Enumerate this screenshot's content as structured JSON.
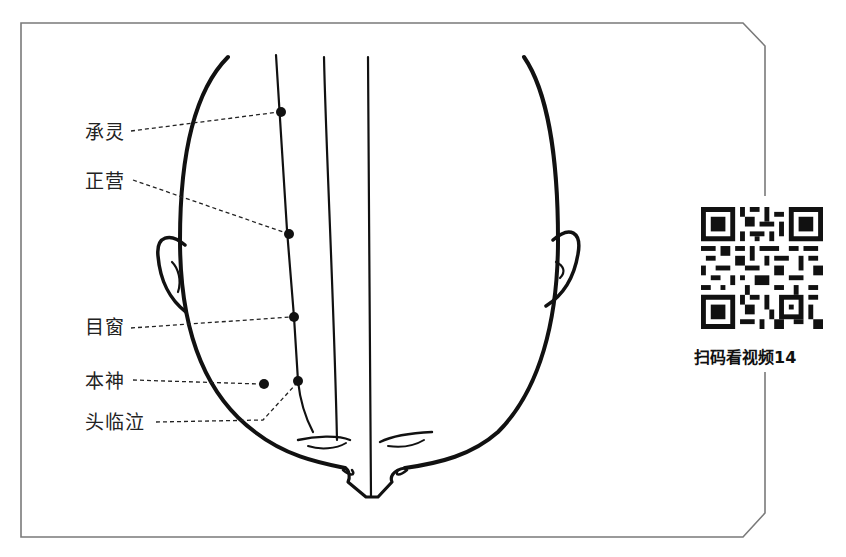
{
  "figure": {
    "stroke_color": "#111111",
    "frame_color": "#777777"
  },
  "labels": [
    {
      "id": "chengling",
      "text": "承灵",
      "x": 85,
      "y": 121,
      "point": {
        "x": 281,
        "y": 112
      }
    },
    {
      "id": "zhengying",
      "text": "正营",
      "x": 85,
      "y": 170,
      "point": {
        "x": 289,
        "y": 234
      }
    },
    {
      "id": "muchuang",
      "text": "目窗",
      "x": 85,
      "y": 316,
      "point": {
        "x": 294,
        "y": 317
      }
    },
    {
      "id": "benshen",
      "text": "本神",
      "x": 85,
      "y": 370,
      "point": {
        "x": 264,
        "y": 384
      }
    },
    {
      "id": "toulinqi",
      "text": "头临泣",
      "x": 85,
      "y": 414,
      "point": {
        "x": 298,
        "y": 381
      }
    }
  ],
  "qr": {
    "caption": "扫码看视频14",
    "icon": "qr-code-icon"
  }
}
